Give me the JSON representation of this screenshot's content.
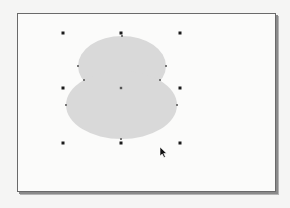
{
  "canvas": {
    "background": "#fbfbfa",
    "border_color": "#6a6a6a"
  },
  "shape": {
    "type": "combined-ellipses",
    "fill": "#d9d9d9",
    "upper_ellipse": {
      "cx": 122,
      "cy": 66,
      "rx": 44,
      "ry": 30
    },
    "lower_ellipse": {
      "cx": 121.5,
      "cy": 105,
      "rx": 55.5,
      "ry": 34
    }
  },
  "selection": {
    "handle_color": "#1a1a1a",
    "handles": [
      {
        "name": "top-left",
        "x": 63,
        "y": 33
      },
      {
        "name": "top-center",
        "x": 121,
        "y": 33
      },
      {
        "name": "top-right",
        "x": 180,
        "y": 33
      },
      {
        "name": "middle-left",
        "x": 63,
        "y": 88
      },
      {
        "name": "middle-right",
        "x": 180,
        "y": 88
      },
      {
        "name": "bottom-left",
        "x": 63,
        "y": 143
      },
      {
        "name": "bottom-center",
        "x": 121,
        "y": 143
      },
      {
        "name": "bottom-right",
        "x": 180,
        "y": 143
      }
    ],
    "center_marker": {
      "x": 121,
      "y": 88
    },
    "nodes": [
      {
        "x": 122,
        "y": 36
      },
      {
        "x": 78,
        "y": 66
      },
      {
        "x": 166,
        "y": 66
      },
      {
        "x": 84,
        "y": 80
      },
      {
        "x": 160,
        "y": 80
      },
      {
        "x": 66,
        "y": 105
      },
      {
        "x": 177,
        "y": 105
      },
      {
        "x": 121,
        "y": 139
      }
    ]
  },
  "cursor": {
    "type": "arrow-pointer",
    "x": 160,
    "y": 147
  }
}
